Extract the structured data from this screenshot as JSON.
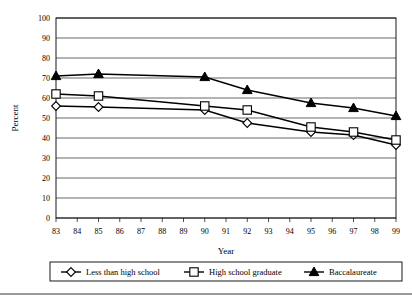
{
  "chart_data": {
    "type": "line",
    "title": "",
    "xlabel": "Year",
    "ylabel": "Percent",
    "ylim": [
      0,
      100
    ],
    "ytick_step": 10,
    "yticks": [
      "0",
      "10",
      "20",
      "30",
      "40",
      "50",
      "60",
      "70",
      "80",
      "90",
      "100"
    ],
    "xlim": [
      "83",
      "99"
    ],
    "xticks": [
      "83",
      "84",
      "85",
      "86",
      "87",
      "88",
      "89",
      "90",
      "91",
      "92",
      "93",
      "94",
      "95",
      "96",
      "97",
      "98",
      "99"
    ],
    "grid": true,
    "legend_position": "bottom",
    "x": [
      "83",
      "85",
      "90",
      "92",
      "95",
      "97",
      "99"
    ],
    "series": [
      {
        "name": "Less than high school",
        "marker": "open-diamond",
        "values": [
          56,
          55.5,
          54,
          47.5,
          43,
          41.5,
          36.5
        ]
      },
      {
        "name": "High school graduate",
        "marker": "open-square",
        "values": [
          62,
          61,
          56,
          54,
          45.5,
          43,
          39
        ]
      },
      {
        "name": "Baccalaureate",
        "marker": "filled-triangle",
        "values": [
          71,
          72,
          70.5,
          64,
          57.5,
          55,
          51
        ]
      }
    ]
  }
}
